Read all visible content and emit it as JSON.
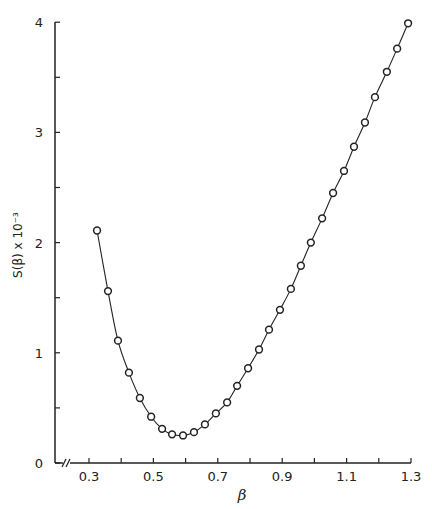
{
  "chart_data": {
    "type": "line",
    "title": "",
    "xlabel": "β",
    "ylabel": "S(β) x 10⁻³",
    "xlim": [
      0.25,
      1.3
    ],
    "ylim": [
      0,
      4
    ],
    "x_axis_break": true,
    "grid": false,
    "legend": null,
    "x_ticks": [
      0.3,
      0.4,
      0.5,
      0.6,
      0.7,
      0.8,
      0.9,
      1.0,
      1.1,
      1.2,
      1.3
    ],
    "x_tick_labels": [
      "0.3",
      "",
      "0.5",
      "",
      "0.7",
      "",
      "0.9",
      "",
      "1.1",
      "",
      "1.3"
    ],
    "y_ticks": [
      0,
      0.5,
      1,
      1.5,
      2,
      2.5,
      3,
      3.5,
      4
    ],
    "y_tick_labels": [
      "0",
      "",
      "1",
      "",
      "2",
      "",
      "3",
      "",
      "4"
    ],
    "series": [
      {
        "name": "S(β)",
        "marker": "open-circle",
        "x": [
          0.325,
          0.359,
          0.39,
          0.424,
          0.458,
          0.493,
          0.527,
          0.558,
          0.592,
          0.626,
          0.66,
          0.694,
          0.729,
          0.76,
          0.794,
          0.828,
          0.859,
          0.893,
          0.927,
          0.958,
          0.989,
          1.024,
          1.058,
          1.092,
          1.123,
          1.157,
          1.188,
          1.225,
          1.257,
          1.291
        ],
        "y": [
          2.11,
          1.56,
          1.11,
          0.82,
          0.59,
          0.42,
          0.31,
          0.26,
          0.25,
          0.28,
          0.35,
          0.45,
          0.55,
          0.7,
          0.86,
          1.03,
          1.21,
          1.39,
          1.58,
          1.79,
          2.0,
          2.22,
          2.45,
          2.65,
          2.87,
          3.09,
          3.32,
          3.55,
          3.76,
          3.99
        ]
      }
    ]
  }
}
